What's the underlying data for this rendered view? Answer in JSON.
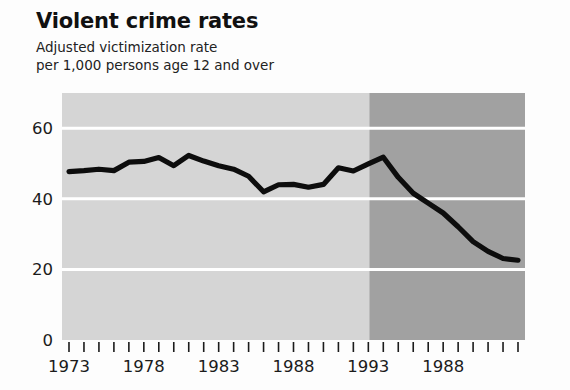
{
  "chart_title": "Violent crime rates",
  "chart_subtitle": "Adjusted victimization rate\nper 1,000 persons age 12 and over",
  "chart_data": {
    "type": "line",
    "title": "Violent crime rates",
    "subtitle": "Adjusted victimization rate per 1,000 persons age 12 and over",
    "xlabel": "",
    "ylabel": "",
    "ylim": [
      0,
      70
    ],
    "xlim": [
      1973,
      2003
    ],
    "grid": true,
    "gridlines_y": [
      20,
      40,
      60
    ],
    "legend": "none",
    "y_ticks": [
      "0",
      "20",
      "40",
      "60"
    ],
    "y_tick_values": [
      0,
      20,
      40,
      60
    ],
    "x_tick_years": [
      1973,
      1974,
      1975,
      1976,
      1977,
      1978,
      1979,
      1980,
      1981,
      1982,
      1983,
      1984,
      1985,
      1986,
      1987,
      1988,
      1989,
      1990,
      1991,
      1992,
      1993,
      1994,
      1995,
      1996,
      1997,
      1998,
      1999,
      2000,
      2001,
      2002,
      2003
    ],
    "x_tick_labels": [
      {
        "year": 1973,
        "label": "1973"
      },
      {
        "year": 1978,
        "label": "1978"
      },
      {
        "year": 1983,
        "label": "1983"
      },
      {
        "year": 1988,
        "label": "1988"
      },
      {
        "year": 1993,
        "label": "1993"
      },
      {
        "year": 1998,
        "label": "1988"
      }
    ],
    "x": [
      1973,
      1974,
      1975,
      1976,
      1977,
      1978,
      1979,
      1980,
      1981,
      1982,
      1983,
      1984,
      1985,
      1986,
      1987,
      1988,
      1989,
      1990,
      1991,
      1992,
      1993,
      1994,
      1995,
      1996,
      1997,
      1998,
      1999,
      2000,
      2001,
      2002,
      2003
    ],
    "values": [
      47.7,
      48.0,
      48.4,
      48.0,
      50.4,
      50.6,
      51.7,
      49.4,
      52.3,
      50.7,
      49.4,
      48.4,
      46.4,
      42.0,
      44.0,
      44.1,
      43.3,
      44.1,
      48.8,
      47.9,
      49.9,
      51.8,
      46.1,
      41.6,
      38.8,
      36.0,
      32.1,
      27.9,
      25.1,
      23.1,
      22.6
    ]
  },
  "colors": {
    "band_left": "#d5d5d5",
    "band_right": "#a1a1a1",
    "line": "#0d0d0d",
    "gridline": "#ffffff",
    "axis": "#1b1b1b",
    "text": "#1a1a1a",
    "page_background": "#fdfdfd"
  },
  "bands": [
    {
      "name": "period-1973-1993",
      "start_year": 1973,
      "end_year": 1993
    },
    {
      "name": "period-1993-2003",
      "start_year": 1993,
      "end_year": 2003
    }
  ]
}
